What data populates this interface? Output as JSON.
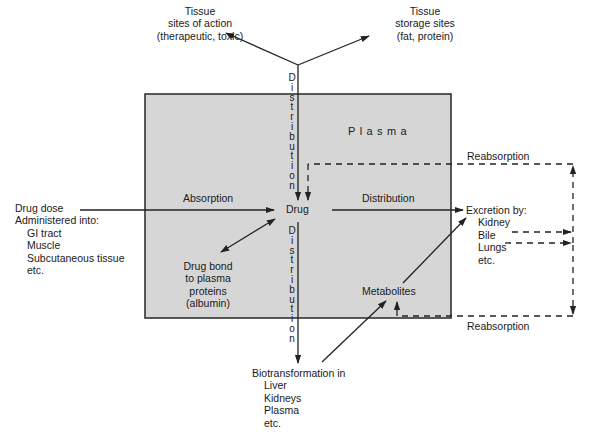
{
  "diagram": {
    "colors": {
      "plasma_fill": "#d6d6d6",
      "line": "#222222",
      "background": "#ffffff"
    },
    "plasma_box": {
      "label": "Plasma"
    },
    "central_node": {
      "label": "Drug"
    },
    "tissue_action": {
      "lines": [
        "Tissue",
        "sites of action",
        "(therapeutic, toxic)"
      ]
    },
    "tissue_storage": {
      "lines": [
        "Tissue",
        "storage sites",
        "(fat, protein)"
      ]
    },
    "drug_dose": {
      "title_lines": [
        "Drug dose",
        "Administered into:"
      ],
      "items": [
        "GI tract",
        "Muscle",
        "Subcutaneous tissue",
        "etc."
      ]
    },
    "absorption": {
      "label": "Absorption"
    },
    "distribution_horizontal": {
      "label": "Distribution"
    },
    "distribution_vertical_top": {
      "label": "Distribution"
    },
    "distribution_vertical_bottom": {
      "label": "Distribution"
    },
    "drug_bond": {
      "lines": [
        "Drug bond",
        "to plasma",
        "proteins",
        "(albumin)"
      ]
    },
    "excretion": {
      "title": "Excretion by:",
      "items": [
        "Kidney",
        "Bile",
        "Lungs",
        "etc."
      ]
    },
    "metabolites": {
      "label": "Metabolites"
    },
    "biotransformation": {
      "title": "Biotransformation in",
      "items": [
        "Liver",
        "Kidneys",
        "Plasma",
        "etc."
      ]
    },
    "reabsorption_top": {
      "label": "Reabsorption"
    },
    "reabsorption_bottom": {
      "label": "Reabsorption"
    }
  }
}
